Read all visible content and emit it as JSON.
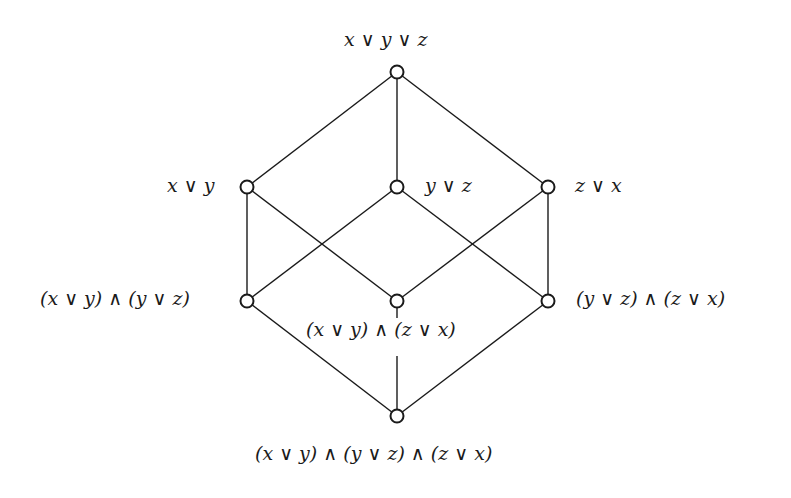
{
  "diagram": {
    "type": "hasse-diagram",
    "title": "",
    "nodes": [
      {
        "id": "top",
        "label": "x ∨ y ∨ z",
        "cx": 397,
        "cy": 72
      },
      {
        "id": "xy",
        "label": "x ∨ y",
        "cx": 247,
        "cy": 187
      },
      {
        "id": "yz",
        "label": "y ∨ z",
        "cx": 397,
        "cy": 187
      },
      {
        "id": "zx",
        "label": "z ∨ x",
        "cx": 548,
        "cy": 187
      },
      {
        "id": "xy_yz",
        "label": "(x ∨ y) ∧ (y ∨ z)",
        "cx": 247,
        "cy": 301
      },
      {
        "id": "xy_zx",
        "label": "(x ∨ y) ∧ (z ∨ x)",
        "cx": 397,
        "cy": 301
      },
      {
        "id": "yz_zx",
        "label": "(y ∨ z) ∧ (z ∨ x)",
        "cx": 548,
        "cy": 301
      },
      {
        "id": "bottom",
        "label": "(x ∨ y) ∧ (y ∨ z) ∧ (z ∨ x)",
        "cx": 397,
        "cy": 416
      }
    ],
    "edges": [
      [
        "top",
        "xy"
      ],
      [
        "top",
        "yz"
      ],
      [
        "top",
        "zx"
      ],
      [
        "xy",
        "xy_yz"
      ],
      [
        "xy",
        "xy_zx"
      ],
      [
        "yz",
        "xy_yz"
      ],
      [
        "yz",
        "yz_zx"
      ],
      [
        "zx",
        "xy_zx"
      ],
      [
        "zx",
        "yz_zx"
      ],
      [
        "xy_yz",
        "bottom"
      ],
      [
        "xy_zx",
        "bottom"
      ],
      [
        "yz_zx",
        "bottom"
      ]
    ],
    "colors": {
      "line": "#1a1a1a",
      "node_fill": "#ffffff",
      "background": "#ffffff"
    }
  },
  "labels": {
    "top": "x ∨ y ∨ z",
    "xy": "x ∨ y",
    "yz": "y ∨ z",
    "zx": "z ∨ x",
    "xy_yz": "(x ∨ y) ∧ (y ∨ z)",
    "xy_zx": "(x ∨ y) ∧ (z ∨ x)",
    "yz_zx": "(y ∨ z) ∧ (z ∨ x)",
    "bottom": "(x ∨ y) ∧ (y ∨ z) ∧ (z ∨ x)"
  }
}
